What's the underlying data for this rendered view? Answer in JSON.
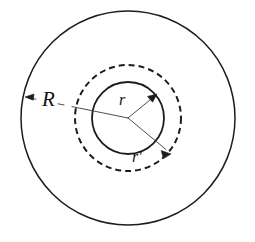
{
  "figure": {
    "background_color": "#ffffff",
    "ink_color": "#1c1c1c",
    "width": 255,
    "height": 242,
    "center": {
      "x": 128,
      "y": 118
    },
    "circles": [
      {
        "name": "outer-circle",
        "style": "solid",
        "radius": 107,
        "label": "R",
        "stroke_width": 1.5
      },
      {
        "name": "middle-circle",
        "style": "dashed",
        "radius": 53,
        "label": "r'",
        "stroke_width": 2.0,
        "dash_pattern": "6 4"
      },
      {
        "name": "inner-circle",
        "style": "solid",
        "radius": 36,
        "label": "r",
        "stroke_width": 1.8
      }
    ],
    "radius_arrows": [
      {
        "name": "radius-arrow-R",
        "label": "R",
        "from": {
          "x": 128,
          "y": 118
        },
        "to": {
          "x": 25,
          "y": 97
        },
        "points_to": "outer-circle",
        "label_position": {
          "x": 42,
          "y": 105
        }
      },
      {
        "name": "radius-arrow-r",
        "label": "r",
        "from": {
          "x": 128,
          "y": 118
        },
        "to": {
          "x": 156,
          "y": 95
        },
        "points_to": "inner-circle",
        "label_position": {
          "x": 120,
          "y": 104
        }
      },
      {
        "name": "radius-arrow-r-prime",
        "label": "r'",
        "from": {
          "x": 128,
          "y": 118
        },
        "to": {
          "x": 170,
          "y": 153
        },
        "points_to": "middle-circle",
        "label_position": {
          "x": 133,
          "y": 160
        }
      }
    ]
  }
}
